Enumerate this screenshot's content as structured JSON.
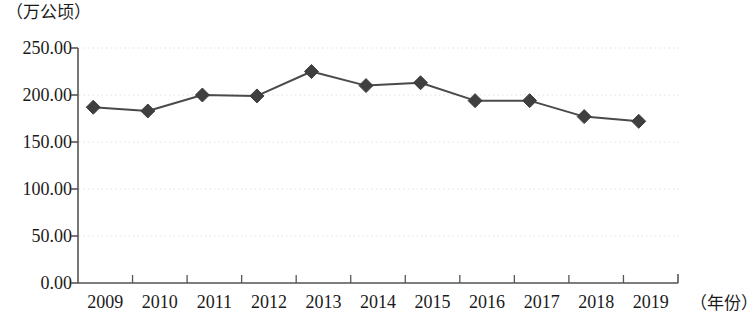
{
  "chart_data": {
    "type": "line",
    "title": "",
    "subtitle": "",
    "xlabel": "（年份）",
    "ylabel": "（万公顷）",
    "categories": [
      "2009",
      "2010",
      "2011",
      "2012",
      "2013",
      "2014",
      "2015",
      "2016",
      "2017",
      "2018",
      "2019"
    ],
    "values": [
      187,
      183,
      200,
      199,
      225,
      210,
      213,
      194,
      194,
      177,
      172
    ],
    "series": [
      {
        "name": "",
        "values": [
          187,
          183,
          200,
          199,
          225,
          210,
          213,
          194,
          194,
          177,
          172
        ]
      }
    ],
    "ylim": [
      0,
      250
    ],
    "ytick_labels": [
      "0.00",
      "50.00",
      "100.00",
      "150.00",
      "200.00",
      "250.00"
    ],
    "ytick_values": [
      0,
      50,
      100,
      150,
      200,
      250
    ],
    "grid": true,
    "grid_axis": "y",
    "grid_style": "dotted",
    "legend": "none",
    "marker": "diamond",
    "colors": {
      "line": "#4a4a4a",
      "marker": "#3f3f3f",
      "axis": "#555555",
      "grid": "#e2e0dd",
      "text": "#1a1a1a",
      "background": "#ffffff"
    }
  }
}
